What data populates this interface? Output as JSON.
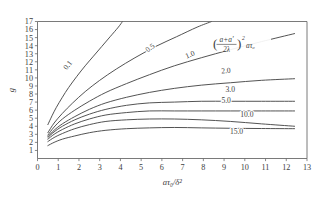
{
  "chart_data": {
    "type": "line",
    "title": "",
    "subtitle": "",
    "xlabel": "aτ₀/δ²",
    "ylabel": "g",
    "xlim": [
      0,
      13
    ],
    "ylim": [
      0,
      17
    ],
    "grid": false,
    "legend_position": "inline-curve-labels",
    "annotation": {
      "numerator": "a+a'",
      "denominator": "2λ",
      "exponent": "2",
      "tail": "aτ₀",
      "full_text": "((a+a')/(2λ))² aτ₀"
    },
    "xticks": [
      0,
      1,
      2,
      3,
      4,
      5,
      6,
      7,
      8,
      9,
      10,
      11,
      12,
      13
    ],
    "xticklabels": [
      "0",
      "1",
      "2",
      "3",
      "4",
      "5",
      "6",
      "7",
      "8",
      "9",
      "10",
      "11",
      "12",
      "13"
    ],
    "yticks": [
      1,
      2,
      3,
      4,
      5,
      6,
      7,
      8,
      9,
      10,
      11,
      12,
      13,
      14,
      15,
      16,
      17
    ],
    "yticklabels": [
      "1",
      "2",
      "3",
      "4",
      "5",
      "6",
      "7",
      "8",
      "9",
      "10",
      "11",
      "12",
      "13",
      "14",
      "15",
      "16",
      "17"
    ],
    "series": [
      {
        "name": "0.1",
        "label": "0.1",
        "label_x": 1.55,
        "label_y": 11.4,
        "label_rotation": -52,
        "x": [
          0.5,
          0.7,
          0.9,
          1.2,
          1.5,
          1.9,
          2.3,
          2.7,
          3.1,
          3.5,
          3.9,
          4.1
        ],
        "y": [
          4.2,
          5.3,
          6.3,
          7.6,
          8.8,
          10.2,
          11.5,
          12.7,
          13.9,
          15.1,
          16.3,
          17.0
        ]
      },
      {
        "name": "0.5",
        "label": "0.5",
        "label_x": 5.5,
        "label_y": 13.5,
        "label_rotation": -37,
        "x": [
          0.5,
          0.8,
          1.2,
          1.7,
          2.3,
          3.0,
          3.8,
          4.7,
          5.7,
          6.7,
          7.7,
          8.4
        ],
        "y": [
          3.2,
          4.4,
          5.6,
          6.9,
          8.3,
          9.7,
          11.1,
          12.5,
          13.9,
          15.1,
          16.3,
          17.0
        ]
      },
      {
        "name": "1.0",
        "label": "1.0",
        "label_x": 7.4,
        "label_y": 12.6,
        "label_rotation": -22,
        "x": [
          0.5,
          0.8,
          1.2,
          1.8,
          2.5,
          3.3,
          4.3,
          5.4,
          6.6,
          7.9,
          9.3,
          10.8,
          12.4
        ],
        "y": [
          2.9,
          3.9,
          4.9,
          6.0,
          7.1,
          8.2,
          9.3,
          10.4,
          11.5,
          12.5,
          13.5,
          14.5,
          15.5
        ]
      },
      {
        "name": "2.0",
        "label": "2.0",
        "label_x": 9.1,
        "label_y": 10.6,
        "label_rotation": -5,
        "x": [
          0.5,
          0.8,
          1.2,
          1.8,
          2.5,
          3.3,
          4.3,
          5.4,
          6.6,
          7.9,
          9.3,
          10.8,
          12.4
        ],
        "y": [
          2.7,
          3.5,
          4.3,
          5.2,
          6.1,
          6.9,
          7.6,
          8.2,
          8.7,
          9.1,
          9.4,
          9.7,
          9.9
        ]
      },
      {
        "name": "3.0",
        "label": "3.0",
        "label_x": 9.3,
        "label_y": 8.2,
        "label_rotation": 0,
        "x": [
          0.5,
          0.8,
          1.2,
          1.8,
          2.5,
          3.3,
          4.3,
          5.4,
          6.6,
          7.9,
          9.3,
          10.8,
          12.4
        ],
        "y": [
          2.6,
          3.3,
          4.0,
          4.8,
          5.5,
          6.1,
          6.6,
          6.9,
          7.0,
          7.1,
          7.1,
          7.1,
          7.1
        ]
      },
      {
        "name": "5.0",
        "label": "5.0",
        "label_x": 9.1,
        "label_y": 6.9,
        "label_rotation": 0,
        "x": [
          0.5,
          0.8,
          1.2,
          1.8,
          2.5,
          3.3,
          4.3,
          5.4,
          6.6,
          7.9,
          9.3,
          10.8,
          12.4
        ],
        "y": [
          2.4,
          3.0,
          3.6,
          4.3,
          4.9,
          5.4,
          5.7,
          5.9,
          5.9,
          5.9,
          5.9,
          5.9,
          5.9
        ]
      },
      {
        "name": "10.0",
        "label": "10.0",
        "label_x": 10.1,
        "label_y": 5.1,
        "label_rotation": 0,
        "x": [
          0.5,
          0.8,
          1.2,
          1.8,
          2.5,
          3.3,
          4.3,
          5.4,
          6.6,
          7.9,
          9.3,
          10.8,
          12.4
        ],
        "y": [
          2.1,
          2.6,
          3.1,
          3.7,
          4.2,
          4.6,
          4.8,
          4.9,
          4.9,
          4.8,
          4.6,
          4.3,
          4.0
        ]
      },
      {
        "name": "15.0",
        "label": "15.0",
        "label_x": 9.6,
        "label_y": 3.1,
        "label_rotation": 0,
        "x": [
          0.5,
          0.8,
          1.2,
          1.8,
          2.5,
          3.3,
          4.3,
          5.4,
          6.6,
          7.9,
          9.3,
          10.8,
          12.4
        ],
        "y": [
          1.6,
          2.0,
          2.4,
          2.8,
          3.2,
          3.5,
          3.7,
          3.8,
          3.85,
          3.8,
          3.75,
          3.72,
          3.7
        ]
      }
    ]
  }
}
